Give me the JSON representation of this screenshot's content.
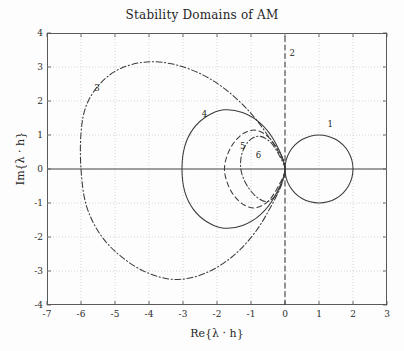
{
  "figure": {
    "title": "Stability Domains of AM",
    "width": 404,
    "height": 351,
    "background": "#fdfdfd",
    "axis_color": "#5a5a5a",
    "grid_color": "#b9b9b9",
    "curve_color": "#3a3a3a"
  },
  "axes": {
    "xlabel": "Re{λ · h}",
    "ylabel": "Im{λ · h}",
    "xlim": [
      -7,
      3
    ],
    "ylim": [
      -4,
      4
    ],
    "xticks": [
      "-7",
      "-6",
      "-5",
      "-4",
      "-3",
      "-2",
      "-1",
      "0",
      "1",
      "2",
      "3"
    ],
    "yticks": [
      "4",
      "3",
      "2",
      "1",
      "0",
      "-1",
      "-2",
      "-3",
      "-4"
    ],
    "grid": "dotted"
  },
  "curve_labels": [
    {
      "text": "1",
      "x": 1.33,
      "y": 1.33
    },
    {
      "text": "2",
      "x": 0.21,
      "y": 3.41
    },
    {
      "text": "3",
      "x": -5.53,
      "y": 2.39
    },
    {
      "text": "4",
      "x": -2.37,
      "y": 1.62
    },
    {
      "text": "5",
      "x": -1.24,
      "y": 0.69
    },
    {
      "text": "6",
      "x": -0.78,
      "y": 0.4
    }
  ],
  "chart_data": {
    "type": "line",
    "title": "Stability Domains of AM",
    "xlabel": "Re{λ · h}",
    "ylabel": "Im{λ · h}",
    "xlim": [
      -7,
      3
    ],
    "ylim": [
      -4,
      4
    ],
    "grid": true,
    "legend": "inline-numeric-labels",
    "series": [
      {
        "name": "1",
        "label": "1",
        "style": "solid",
        "description": "Adams-Moulton order 1 (backward Euler) stability boundary: unit circle centred at (1,0)",
        "points": [
          [
            2.0,
            0.0
          ],
          [
            1.966,
            0.259
          ],
          [
            1.866,
            0.5
          ],
          [
            1.707,
            0.707
          ],
          [
            1.5,
            0.866
          ],
          [
            1.259,
            0.966
          ],
          [
            1.0,
            1.0
          ],
          [
            0.741,
            0.966
          ],
          [
            0.5,
            0.866
          ],
          [
            0.293,
            0.707
          ],
          [
            0.134,
            0.5
          ],
          [
            0.034,
            0.259
          ],
          [
            0.0,
            0.0
          ],
          [
            0.034,
            -0.259
          ],
          [
            0.134,
            -0.5
          ],
          [
            0.293,
            -0.707
          ],
          [
            0.5,
            -0.866
          ],
          [
            0.741,
            -0.966
          ],
          [
            1.0,
            -1.0
          ],
          [
            1.259,
            -0.966
          ],
          [
            1.5,
            -0.866
          ],
          [
            1.707,
            -0.707
          ],
          [
            1.866,
            -0.5
          ],
          [
            1.966,
            -0.259
          ],
          [
            2.0,
            0.0
          ]
        ]
      },
      {
        "name": "2",
        "label": "2",
        "style": "dashed",
        "description": "Adams-Moulton order 2 (trapezoidal) stability boundary: the imaginary axis Re = 0",
        "points": [
          [
            0.0,
            -4.0
          ],
          [
            0.0,
            4.0
          ]
        ]
      },
      {
        "name": "3",
        "label": "3",
        "style": "dashdot",
        "description": "Adams-Moulton order 3 stability boundary: large closed loop reaching Re = -6",
        "points": [
          [
            0.0,
            0.0
          ],
          [
            -0.55,
            1.05
          ],
          [
            -1.3,
            1.95
          ],
          [
            -2.2,
            2.65
          ],
          [
            -3.15,
            3.05
          ],
          [
            -4.05,
            3.15
          ],
          [
            -4.85,
            2.95
          ],
          [
            -5.45,
            2.5
          ],
          [
            -5.85,
            1.85
          ],
          [
            -6.0,
            1.05
          ],
          [
            -6.0,
            0.0
          ],
          [
            -5.85,
            -1.05
          ],
          [
            -5.45,
            -1.9
          ],
          [
            -4.85,
            -2.55
          ],
          [
            -4.05,
            -3.05
          ],
          [
            -3.15,
            -3.25
          ],
          [
            -2.2,
            -3.0
          ],
          [
            -1.3,
            -2.35
          ],
          [
            -0.55,
            -1.35
          ],
          [
            0.0,
            0.0
          ]
        ]
      },
      {
        "name": "4",
        "label": "4",
        "style": "solid",
        "description": "Adams-Moulton order 4 stability boundary: loop reaching Re = -3",
        "points": [
          [
            0.0,
            0.0
          ],
          [
            -0.3,
            0.8
          ],
          [
            -0.72,
            1.34
          ],
          [
            -1.25,
            1.66
          ],
          [
            -1.8,
            1.74
          ],
          [
            -2.3,
            1.55
          ],
          [
            -2.7,
            1.18
          ],
          [
            -2.95,
            0.66
          ],
          [
            -3.03,
            0.0
          ],
          [
            -2.95,
            -0.66
          ],
          [
            -2.7,
            -1.18
          ],
          [
            -2.3,
            -1.55
          ],
          [
            -1.8,
            -1.74
          ],
          [
            -1.25,
            -1.66
          ],
          [
            -0.72,
            -1.34
          ],
          [
            -0.3,
            -0.8
          ],
          [
            0.0,
            0.0
          ]
        ]
      },
      {
        "name": "5",
        "label": "5",
        "style": "dashed",
        "description": "Adams-Moulton order 5 stability boundary: narrow loop reaching Re = -1.85",
        "points": [
          [
            0.0,
            0.0
          ],
          [
            -0.22,
            0.55
          ],
          [
            -0.5,
            0.95
          ],
          [
            -0.85,
            1.14
          ],
          [
            -1.2,
            1.06
          ],
          [
            -1.5,
            0.78
          ],
          [
            -1.7,
            0.4
          ],
          [
            -1.78,
            0.0
          ],
          [
            -1.7,
            -0.4
          ],
          [
            -1.5,
            -0.78
          ],
          [
            -1.2,
            -1.06
          ],
          [
            -0.85,
            -1.14
          ],
          [
            -0.5,
            -0.95
          ],
          [
            -0.22,
            -0.55
          ],
          [
            0.0,
            0.0
          ]
        ]
      },
      {
        "name": "6",
        "label": "6",
        "style": "dashdot",
        "description": "Adams-Moulton order 6 stability boundary: small lobed loop reaching Re = -1.3",
        "points": [
          [
            0.0,
            0.0
          ],
          [
            -0.18,
            0.42
          ],
          [
            -0.42,
            0.78
          ],
          [
            -0.72,
            0.96
          ],
          [
            -1.0,
            0.88
          ],
          [
            -1.2,
            0.62
          ],
          [
            -1.3,
            0.28
          ],
          [
            -1.28,
            -0.1
          ],
          [
            -1.12,
            -0.48
          ],
          [
            -0.86,
            -0.8
          ],
          [
            -0.55,
            -0.96
          ],
          [
            -0.28,
            -0.78
          ],
          [
            -0.1,
            -0.42
          ],
          [
            0.0,
            0.0
          ]
        ]
      }
    ]
  }
}
